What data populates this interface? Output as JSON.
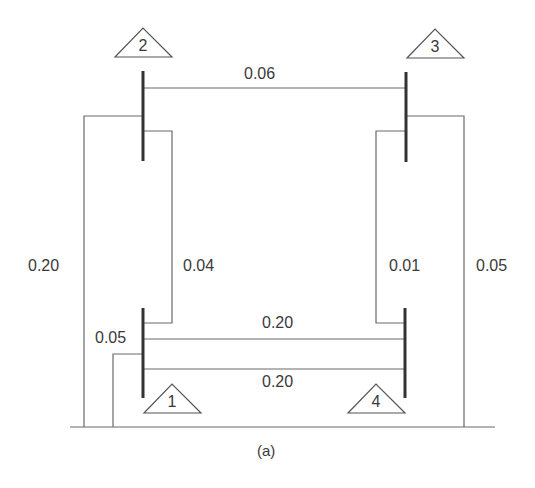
{
  "figure": {
    "caption": "(a)",
    "buses": [
      {
        "id": "1",
        "label": "1"
      },
      {
        "id": "2",
        "label": "2"
      },
      {
        "id": "3",
        "label": "3"
      },
      {
        "id": "4",
        "label": "4"
      }
    ],
    "branches": [
      {
        "from": "2",
        "to": "3",
        "value": "0.06"
      },
      {
        "from": "2",
        "to": "ground",
        "value": "0.20"
      },
      {
        "from": "2",
        "to": "1",
        "value": "0.04"
      },
      {
        "from": "3",
        "to": "4",
        "value": "0.01"
      },
      {
        "from": "3",
        "to": "ground",
        "value": "0.05"
      },
      {
        "from": "1",
        "to": "4",
        "value": "0.20",
        "position": "upper"
      },
      {
        "from": "1",
        "to": "4",
        "value": "0.20",
        "position": "lower"
      },
      {
        "from": "1",
        "to": "ground",
        "value": "0.05"
      }
    ],
    "colors": {
      "line": "#6a6a6a",
      "bus": "#333333",
      "text": "#3a3a3a",
      "background": "#ffffff"
    }
  }
}
